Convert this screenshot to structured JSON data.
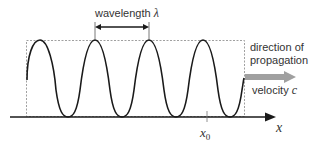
{
  "diagram": {
    "wavelength_label": "wavelength",
    "wavelength_symbol": "λ",
    "direction_line1": "direction of",
    "direction_line2": "propagation",
    "velocity_label": "velocity",
    "velocity_symbol": "c",
    "axis_label": "x",
    "position_label": "x",
    "position_subscript": "0",
    "colors": {
      "wave": "#1a1a1a",
      "axis": "#1a1a1a",
      "dashed_box": "#888888",
      "velocity_arrow": "#a0a0a0",
      "text": "#333333"
    }
  }
}
